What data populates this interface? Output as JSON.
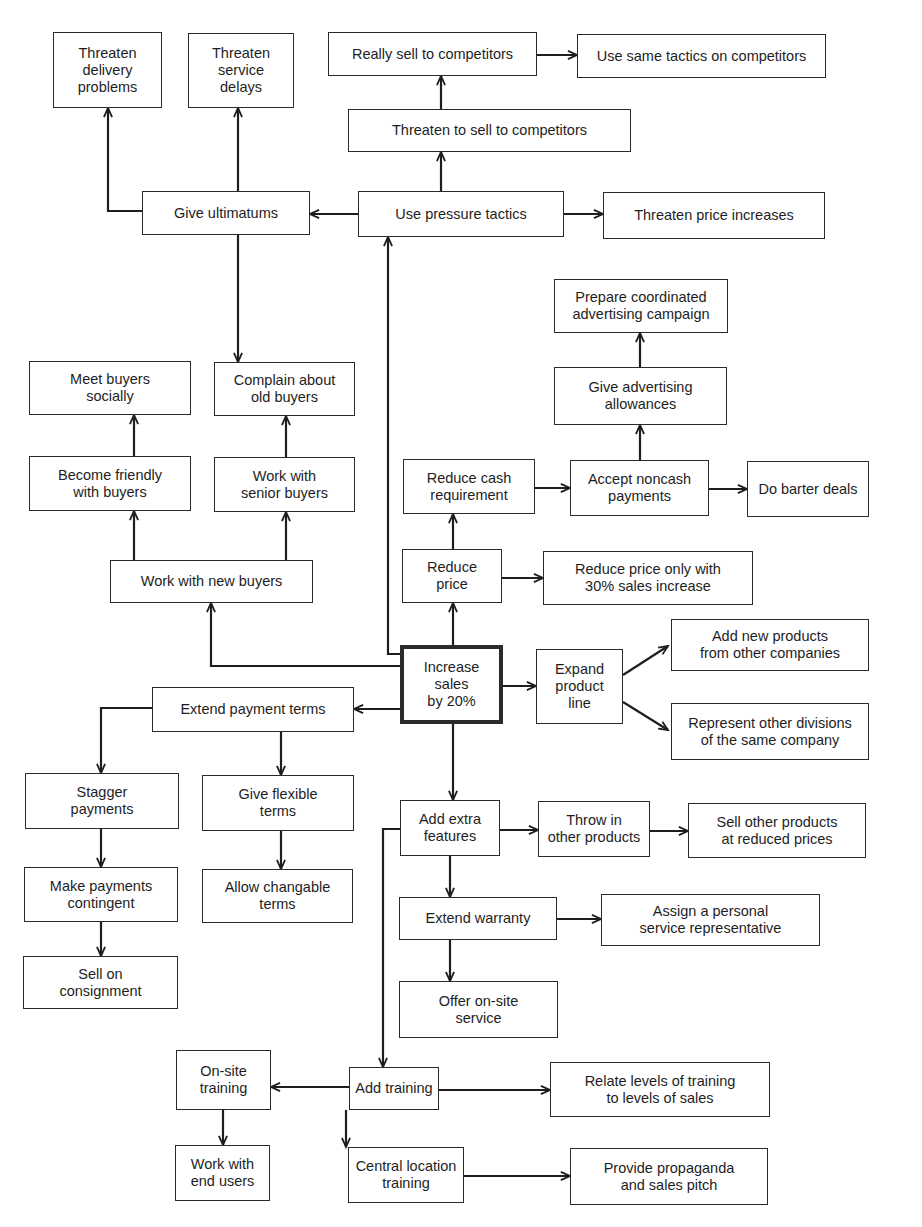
{
  "diagram": {
    "title": "Increase sales by 20%",
    "root_id": "increase_sales",
    "nodes": [
      {
        "id": "threaten_delivery",
        "label": "Threaten\ndelivery\nproblems",
        "x": 53,
        "y": 32,
        "w": 109,
        "h": 76
      },
      {
        "id": "threaten_service",
        "label": "Threaten\nservice\ndelays",
        "x": 188,
        "y": 33,
        "w": 106,
        "h": 75
      },
      {
        "id": "really_sell",
        "label": "Really sell to competitors",
        "x": 328,
        "y": 32,
        "w": 209,
        "h": 44
      },
      {
        "id": "same_tactics",
        "label": "Use same tactics on competitors",
        "x": 577,
        "y": 34,
        "w": 249,
        "h": 44
      },
      {
        "id": "threaten_sell",
        "label": "Threaten to sell to competitors",
        "x": 348,
        "y": 109,
        "w": 283,
        "h": 43
      },
      {
        "id": "give_ultimatums",
        "label": "Give ultimatums",
        "x": 142,
        "y": 191,
        "w": 168,
        "h": 44
      },
      {
        "id": "pressure_tactics",
        "label": "Use pressure tactics",
        "x": 358,
        "y": 191,
        "w": 206,
        "h": 46
      },
      {
        "id": "threaten_price",
        "label": "Threaten price increases",
        "x": 603,
        "y": 192,
        "w": 222,
        "h": 47
      },
      {
        "id": "prepare_campaign",
        "label": "Prepare coordinated\nadvertising campaign",
        "x": 554,
        "y": 279,
        "w": 174,
        "h": 54
      },
      {
        "id": "meet_socially",
        "label": "Meet buyers\nsocially",
        "x": 29,
        "y": 361,
        "w": 162,
        "h": 54
      },
      {
        "id": "complain_old",
        "label": "Complain about\nold buyers",
        "x": 214,
        "y": 362,
        "w": 141,
        "h": 54
      },
      {
        "id": "ad_allowances",
        "label": "Give advertising\nallowances",
        "x": 554,
        "y": 367,
        "w": 173,
        "h": 58
      },
      {
        "id": "become_friendly",
        "label": "Become friendly\nwith buyers",
        "x": 29,
        "y": 456,
        "w": 162,
        "h": 55
      },
      {
        "id": "senior_buyers",
        "label": "Work with\nsenior buyers",
        "x": 214,
        "y": 457,
        "w": 141,
        "h": 55
      },
      {
        "id": "reduce_cash",
        "label": "Reduce cash\nrequirement",
        "x": 403,
        "y": 459,
        "w": 132,
        "h": 55
      },
      {
        "id": "noncash",
        "label": "Accept noncash\npayments",
        "x": 570,
        "y": 460,
        "w": 139,
        "h": 56
      },
      {
        "id": "barter",
        "label": "Do barter deals",
        "x": 747,
        "y": 461,
        "w": 122,
        "h": 56
      },
      {
        "id": "reduce_price",
        "label": "Reduce\nprice",
        "x": 402,
        "y": 549,
        "w": 100,
        "h": 54
      },
      {
        "id": "reduce_price_30",
        "label": "Reduce price only with\n30% sales increase",
        "x": 543,
        "y": 551,
        "w": 210,
        "h": 54
      },
      {
        "id": "new_buyers",
        "label": "Work with new buyers",
        "x": 110,
        "y": 560,
        "w": 203,
        "h": 43
      },
      {
        "id": "add_new_products",
        "label": "Add new products\nfrom other companies",
        "x": 671,
        "y": 619,
        "w": 198,
        "h": 52
      },
      {
        "id": "increase_sales",
        "label": "Increase\nsales\nby 20%",
        "x": 400,
        "y": 645,
        "w": 103,
        "h": 79
      },
      {
        "id": "expand_line",
        "label": "Expand\nproduct\nline",
        "x": 536,
        "y": 649,
        "w": 87,
        "h": 75
      },
      {
        "id": "extend_payment",
        "label": "Extend payment terms",
        "x": 152,
        "y": 687,
        "w": 202,
        "h": 45
      },
      {
        "id": "represent_divisions",
        "label": "Represent other divisions\nof the same company",
        "x": 671,
        "y": 703,
        "w": 198,
        "h": 57
      },
      {
        "id": "stagger",
        "label": "Stagger\npayments",
        "x": 25,
        "y": 773,
        "w": 154,
        "h": 56
      },
      {
        "id": "flexible_terms",
        "label": "Give flexible\nterms",
        "x": 202,
        "y": 775,
        "w": 152,
        "h": 56
      },
      {
        "id": "extra_features",
        "label": "Add extra\nfeatures",
        "x": 400,
        "y": 800,
        "w": 100,
        "h": 56
      },
      {
        "id": "throw_in",
        "label": "Throw in\nother products",
        "x": 538,
        "y": 801,
        "w": 112,
        "h": 56
      },
      {
        "id": "sell_other_reduced",
        "label": "Sell other products\nat reduced prices",
        "x": 688,
        "y": 803,
        "w": 178,
        "h": 55
      },
      {
        "id": "contingent",
        "label": "Make payments\ncontingent",
        "x": 24,
        "y": 867,
        "w": 154,
        "h": 55
      },
      {
        "id": "changable_terms",
        "label": "Allow changable\nterms",
        "x": 202,
        "y": 869,
        "w": 151,
        "h": 54
      },
      {
        "id": "personal_rep",
        "label": "Assign a personal\nservice representative",
        "x": 601,
        "y": 894,
        "w": 219,
        "h": 52
      },
      {
        "id": "extend_warranty",
        "label": "Extend warranty",
        "x": 399,
        "y": 897,
        "w": 158,
        "h": 43
      },
      {
        "id": "consignment",
        "label": "Sell on\nconsignment",
        "x": 23,
        "y": 956,
        "w": 155,
        "h": 53
      },
      {
        "id": "onsite_service",
        "label": "Offer on-site\nservice",
        "x": 399,
        "y": 981,
        "w": 159,
        "h": 57
      },
      {
        "id": "onsite_training",
        "label": "On-site\ntraining",
        "x": 176,
        "y": 1050,
        "w": 95,
        "h": 60
      },
      {
        "id": "relate_levels",
        "label": "Relate levels of training\nto levels of sales",
        "x": 550,
        "y": 1062,
        "w": 220,
        "h": 55
      },
      {
        "id": "add_training",
        "label": "Add training",
        "x": 349,
        "y": 1067,
        "w": 90,
        "h": 43
      },
      {
        "id": "end_users",
        "label": "Work with\nend users",
        "x": 175,
        "y": 1145,
        "w": 95,
        "h": 56
      },
      {
        "id": "central_training",
        "label": "Central location\ntraining",
        "x": 348,
        "y": 1147,
        "w": 116,
        "h": 56
      },
      {
        "id": "propaganda",
        "label": "Provide propaganda\nand sales pitch",
        "x": 570,
        "y": 1148,
        "w": 198,
        "h": 57
      }
    ],
    "edges": [
      {
        "from": "increase_sales",
        "to": "pressure_tactics",
        "points": [
          [
            400,
            654
          ],
          [
            388,
            654
          ],
          [
            388,
            237
          ]
        ]
      },
      {
        "from": "increase_sales",
        "to": "new_buyers",
        "points": [
          [
            400,
            666
          ],
          [
            211,
            666
          ],
          [
            211,
            603
          ]
        ]
      },
      {
        "from": "increase_sales",
        "to": "reduce_price",
        "points": [
          [
            453,
            645
          ],
          [
            453,
            603
          ]
        ]
      },
      {
        "from": "increase_sales",
        "to": "expand_line",
        "points": [
          [
            503,
            686
          ],
          [
            536,
            686
          ]
        ]
      },
      {
        "from": "increase_sales",
        "to": "extend_payment",
        "points": [
          [
            400,
            709
          ],
          [
            354,
            709
          ]
        ]
      },
      {
        "from": "increase_sales",
        "to": "extra_features",
        "points": [
          [
            453,
            724
          ],
          [
            453,
            800
          ]
        ]
      },
      {
        "from": "pressure_tactics",
        "to": "threaten_sell",
        "points": [
          [
            441,
            191
          ],
          [
            441,
            152
          ]
        ]
      },
      {
        "from": "threaten_sell",
        "to": "really_sell",
        "points": [
          [
            441,
            109
          ],
          [
            441,
            76
          ]
        ]
      },
      {
        "from": "really_sell",
        "to": "same_tactics",
        "points": [
          [
            537,
            55
          ],
          [
            577,
            55
          ]
        ]
      },
      {
        "from": "pressure_tactics",
        "to": "threaten_price",
        "points": [
          [
            564,
            214
          ],
          [
            603,
            214
          ]
        ]
      },
      {
        "from": "pressure_tactics",
        "to": "give_ultimatums",
        "points": [
          [
            358,
            214
          ],
          [
            310,
            214
          ]
        ]
      },
      {
        "from": "give_ultimatums",
        "to": "threaten_delivery",
        "points": [
          [
            142,
            211
          ],
          [
            108,
            211
          ],
          [
            108,
            108
          ]
        ]
      },
      {
        "from": "give_ultimatums",
        "to": "threaten_service",
        "points": [
          [
            238,
            191
          ],
          [
            238,
            108
          ]
        ]
      },
      {
        "from": "give_ultimatums",
        "to": "complain_old",
        "points": [
          [
            238,
            235
          ],
          [
            238,
            362
          ]
        ]
      },
      {
        "from": "new_buyers",
        "to": "become_friendly",
        "points": [
          [
            134,
            560
          ],
          [
            134,
            511
          ]
        ]
      },
      {
        "from": "new_buyers",
        "to": "senior_buyers",
        "points": [
          [
            286,
            560
          ],
          [
            286,
            512
          ]
        ]
      },
      {
        "from": "become_friendly",
        "to": "meet_socially",
        "points": [
          [
            134,
            456
          ],
          [
            134,
            415
          ]
        ]
      },
      {
        "from": "senior_buyers",
        "to": "complain_old",
        "points": [
          [
            286,
            457
          ],
          [
            286,
            416
          ]
        ]
      },
      {
        "from": "reduce_price",
        "to": "reduce_cash",
        "points": [
          [
            453,
            549
          ],
          [
            453,
            514
          ]
        ]
      },
      {
        "from": "reduce_price",
        "to": "reduce_price_30",
        "points": [
          [
            502,
            578
          ],
          [
            543,
            578
          ]
        ]
      },
      {
        "from": "reduce_cash",
        "to": "noncash",
        "points": [
          [
            535,
            488
          ],
          [
            570,
            488
          ]
        ]
      },
      {
        "from": "noncash",
        "to": "barter",
        "points": [
          [
            709,
            489
          ],
          [
            747,
            489
          ]
        ]
      },
      {
        "from": "noncash",
        "to": "ad_allowances",
        "points": [
          [
            640,
            460
          ],
          [
            640,
            425
          ]
        ]
      },
      {
        "from": "ad_allowances",
        "to": "prepare_campaign",
        "points": [
          [
            640,
            367
          ],
          [
            640,
            333
          ]
        ]
      },
      {
        "from": "expand_line",
        "to": "add_new_products",
        "points": [
          [
            623,
            675
          ],
          [
            668,
            646
          ]
        ]
      },
      {
        "from": "expand_line",
        "to": "represent_divisions",
        "points": [
          [
            623,
            702
          ],
          [
            668,
            730
          ]
        ]
      },
      {
        "from": "extend_payment",
        "to": "stagger",
        "points": [
          [
            152,
            708
          ],
          [
            101,
            708
          ],
          [
            101,
            773
          ]
        ]
      },
      {
        "from": "extend_payment",
        "to": "flexible_terms",
        "points": [
          [
            281,
            732
          ],
          [
            281,
            775
          ]
        ]
      },
      {
        "from": "stagger",
        "to": "contingent",
        "points": [
          [
            101,
            829
          ],
          [
            101,
            867
          ]
        ]
      },
      {
        "from": "flexible_terms",
        "to": "changable_terms",
        "points": [
          [
            281,
            831
          ],
          [
            281,
            869
          ]
        ]
      },
      {
        "from": "contingent",
        "to": "consignment",
        "points": [
          [
            101,
            922
          ],
          [
            101,
            956
          ]
        ]
      },
      {
        "from": "extra_features",
        "to": "throw_in",
        "points": [
          [
            500,
            830
          ],
          [
            538,
            830
          ]
        ]
      },
      {
        "from": "throw_in",
        "to": "sell_other_reduced",
        "points": [
          [
            650,
            831
          ],
          [
            688,
            831
          ]
        ]
      },
      {
        "from": "extra_features",
        "to": "extend_warranty",
        "points": [
          [
            450,
            856
          ],
          [
            450,
            897
          ]
        ]
      },
      {
        "from": "extend_warranty",
        "to": "personal_rep",
        "points": [
          [
            557,
            919
          ],
          [
            601,
            919
          ]
        ]
      },
      {
        "from": "extend_warranty",
        "to": "onsite_service",
        "points": [
          [
            450,
            940
          ],
          [
            450,
            981
          ]
        ]
      },
      {
        "from": "extra_features",
        "to": "add_training",
        "points": [
          [
            400,
            829
          ],
          [
            383,
            829
          ],
          [
            383,
            1067
          ]
        ]
      },
      {
        "from": "add_training",
        "to": "onsite_training",
        "points": [
          [
            349,
            1087
          ],
          [
            271,
            1087
          ]
        ]
      },
      {
        "from": "add_training",
        "to": "relate_levels",
        "points": [
          [
            439,
            1090
          ],
          [
            550,
            1090
          ]
        ]
      },
      {
        "from": "add_training",
        "to": "central_training",
        "points": [
          [
            346,
            1110
          ],
          [
            346,
            1147
          ]
        ]
      },
      {
        "from": "onsite_training",
        "to": "end_users",
        "points": [
          [
            223,
            1110
          ],
          [
            223,
            1145
          ]
        ]
      },
      {
        "from": "central_training",
        "to": "propaganda",
        "points": [
          [
            464,
            1176
          ],
          [
            570,
            1176
          ]
        ]
      }
    ]
  },
  "colors": {
    "background": "#ffffff",
    "stroke": "#1e1e1e",
    "text": "#1e1e1e"
  }
}
